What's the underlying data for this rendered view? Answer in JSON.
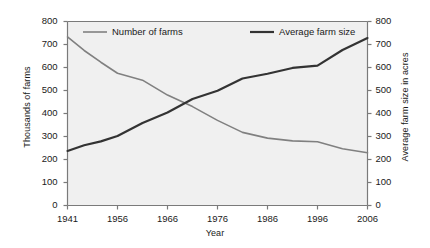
{
  "chart_data": {
    "type": "line",
    "title": "",
    "xlabel": "Year",
    "ylabel": "Thousands of farms",
    "ylabel_right": "Average farm size in acres",
    "x": [
      1941,
      1956,
      1966,
      1976,
      1986,
      1996,
      2006
    ],
    "xtick_labels": [
      "1941",
      "1956",
      "1966",
      "1976",
      "1986",
      "1996",
      "2006"
    ],
    "ylim": [
      0,
      800
    ],
    "ylim_right": [
      0,
      800
    ],
    "ytick_labels": [
      "0",
      "100",
      "200",
      "300",
      "400",
      "500",
      "600",
      "700",
      "800"
    ],
    "ytick_values": [
      0,
      100,
      200,
      300,
      400,
      500,
      600,
      700,
      800
    ],
    "ytick_labels_right": [
      "0",
      "100",
      "200",
      "300",
      "400",
      "500",
      "600",
      "700",
      "800"
    ],
    "ytick_values_right": [
      0,
      100,
      200,
      300,
      400,
      500,
      600,
      700,
      800
    ],
    "grid": false,
    "legend_position": "top-inside",
    "series": [
      {
        "name": "Number of farms",
        "axis": "left",
        "color": "#808080",
        "width": 1.6,
        "x": [
          1941,
          1946,
          1951,
          1956,
          1961,
          1966,
          1971,
          1976,
          1981,
          1986,
          1991,
          1996,
          2001,
          2006
        ],
        "values": [
          733,
          674,
          623,
          575,
          545,
          480,
          430,
          370,
          318,
          293,
          281,
          277,
          247,
          229
        ]
      },
      {
        "name": "Average farm size",
        "axis": "right",
        "color": "#333333",
        "width": 2.2,
        "x": [
          1941,
          1946,
          1951,
          1956,
          1961,
          1966,
          1971,
          1976,
          1981,
          1986,
          1991,
          1996,
          2001,
          2006
        ],
        "values": [
          237,
          262,
          279,
          302,
          359,
          404,
          463,
          499,
          552,
          573,
          598,
          608,
          676,
          728
        ]
      }
    ]
  },
  "legend": {
    "items": [
      {
        "label": "Number of farms",
        "color": "#808080"
      },
      {
        "label": "Average farm size",
        "color": "#333333"
      }
    ]
  },
  "plot_style": {
    "background": "#f0f0f0",
    "axis_color": "#7a7a7a",
    "text_color": "#1a1a1a"
  }
}
